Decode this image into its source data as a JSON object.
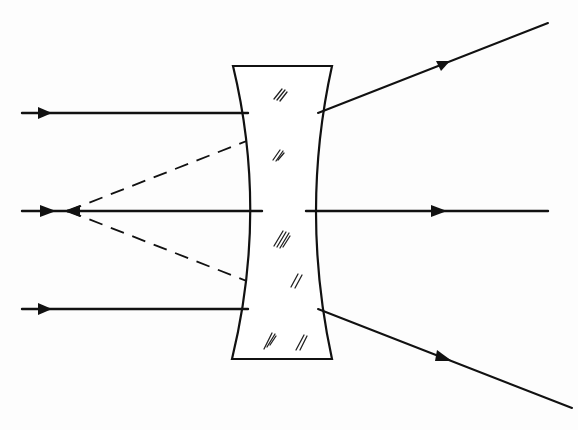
{
  "figure": {
    "title": "",
    "elements": {
      "lens": {
        "type": "biconcave-lens",
        "top_y": 66,
        "bottom_y": 359,
        "top_x": [
          233,
          332
        ],
        "bottom_x": [
          232,
          332
        ],
        "waist_x": [
          262,
          306
        ],
        "center_y": 211
      },
      "focal_point": {
        "type": "virtual-focus",
        "x": 68,
        "y": 211
      },
      "incident_rays": [
        {
          "id": "top",
          "y": 113,
          "from_x": 22,
          "to_x": 248
        },
        {
          "id": "center",
          "y": 211,
          "from_x": 22,
          "to_x": 262
        },
        {
          "id": "bottom",
          "y": 309,
          "from_x": 22,
          "to_x": 248
        }
      ],
      "refracted_rays": [
        {
          "id": "top",
          "from": [
            318,
            113
          ],
          "to": [
            548,
            23
          ]
        },
        {
          "id": "center",
          "from": [
            306,
            211
          ],
          "to": [
            548,
            211
          ]
        },
        {
          "id": "bottom",
          "from": [
            318,
            309
          ],
          "to": [
            572,
            408
          ]
        }
      ],
      "virtual_rays": [
        {
          "id": "top",
          "from": [
            68,
            211
          ],
          "to": [
            318,
            113
          ],
          "style": "dashed"
        },
        {
          "id": "bottom",
          "from": [
            68,
            211
          ],
          "to": [
            318,
            309
          ],
          "style": "dashed"
        }
      ]
    },
    "colors": {
      "line": "#111111",
      "background": "#fdfdfd",
      "lens_fill": "#ffffff"
    },
    "labels": []
  }
}
